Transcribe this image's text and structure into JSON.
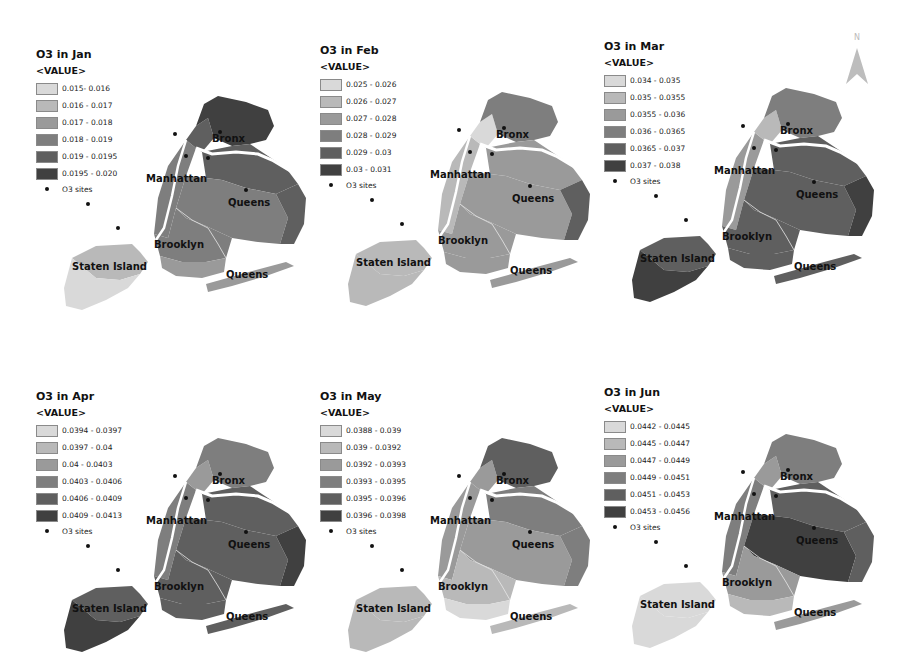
{
  "north_arrow": {
    "label": "N",
    "icon": "north-arrow-icon"
  },
  "legend_header": "<VALUE>",
  "sites_label": "O3 sites",
  "boroughs": {
    "bronx": "Bronx",
    "manhattan": "Manhattan",
    "queens": "Queens",
    "brooklyn": "Brooklyn",
    "staten_island": "Staten Island",
    "queens_south": "Queens"
  },
  "class_colors": [
    "#d9d9d9",
    "#b9b9b9",
    "#9a9a9a",
    "#7e7e7e",
    "#5f5f5f",
    "#404040"
  ],
  "panels": [
    {
      "title": "O3 in Jan",
      "legend": [
        "0.015- 0.016",
        "0.016 - 0.017",
        "0.017 - 0.018",
        "0.018 - 0.019",
        "0.019 - 0.0195",
        "0.0195 - 0.020"
      ],
      "zones": {
        "bronx": 5,
        "manhattan": 3,
        "upper_manhattan": 4,
        "queens_north": 4,
        "queens": 3,
        "queens_east": 4,
        "brooklyn": 3,
        "brooklyn_south": 2,
        "staten_island": 1,
        "staten_south": 0,
        "rockaway": 2
      }
    },
    {
      "title": "O3 in Feb",
      "legend": [
        "0.025 - 0.026",
        "0.026 - 0.027",
        "0.027 - 0.028",
        "0.028 - 0.029",
        "0.029 - 0.03",
        "0.03 - 0.031"
      ],
      "zones": {
        "bronx": 3,
        "manhattan": 1,
        "upper_manhattan": 0,
        "queens_north": 2,
        "queens": 2,
        "queens_east": 4,
        "brooklyn": 2,
        "brooklyn_south": 2,
        "staten_island": 1,
        "staten_south": 1,
        "rockaway": 2
      }
    },
    {
      "title": "O3 in Mar",
      "legend": [
        "0.034 - 0.035",
        "0.035 - 0.0355",
        "0.0355 - 0.036",
        "0.036 - 0.0365",
        "0.0365 - 0.037",
        "0.037 - 0.038"
      ],
      "zones": {
        "bronx": 3,
        "manhattan": 2,
        "upper_manhattan": 1,
        "queens_north": 4,
        "queens": 4,
        "queens_east": 5,
        "brooklyn": 4,
        "brooklyn_south": 4,
        "staten_island": 4,
        "staten_south": 5,
        "rockaway": 4
      }
    },
    {
      "title": "O3 in Apr",
      "legend": [
        "0.0394 - 0.0397",
        "0.0397 - 0.04",
        "0.04 - 0.0403",
        "0.0403 - 0.0406",
        "0.0406 - 0.0409",
        "0.0409 - 0.0413"
      ],
      "zones": {
        "bronx": 3,
        "manhattan": 3,
        "upper_manhattan": 2,
        "queens_north": 4,
        "queens": 4,
        "queens_east": 5,
        "brooklyn": 4,
        "brooklyn_south": 4,
        "staten_island": 4,
        "staten_south": 5,
        "rockaway": 4
      }
    },
    {
      "title": "O3 in May",
      "legend": [
        "0.0388 - 0.039",
        "0.039 - 0.0392",
        "0.0392 - 0.0393",
        "0.0393 - 0.0395",
        "0.0395 - 0.0396",
        "0.0396 - 0.0398"
      ],
      "zones": {
        "bronx": 4,
        "manhattan": 2,
        "upper_manhattan": 2,
        "queens_north": 3,
        "queens": 2,
        "queens_east": 3,
        "brooklyn": 1,
        "brooklyn_south": 0,
        "staten_island": 1,
        "staten_south": 1,
        "rockaway": 1
      }
    },
    {
      "title": "O3 in Jun",
      "legend": [
        "0.0442 - 0.0445",
        "0.0445 - 0.0447",
        "0.0447 - 0.0449",
        "0.0449 - 0.0451",
        "0.0451 - 0.0453",
        "0.0453 - 0.0456"
      ],
      "zones": {
        "bronx": 3,
        "manhattan": 3,
        "upper_manhattan": 2,
        "queens_north": 4,
        "queens": 5,
        "queens_east": 4,
        "brooklyn": 2,
        "brooklyn_south": 1,
        "staten_island": 0,
        "staten_south": 0,
        "rockaway": 2
      }
    }
  ],
  "chart_data": {
    "type": "heatmap",
    "panels": [
      {
        "month": "Jan",
        "classes": [
          "0.015- 0.016",
          "0.016 - 0.017",
          "0.017 - 0.018",
          "0.018 - 0.019",
          "0.019 - 0.0195",
          "0.0195 - 0.020"
        ],
        "range": [
          0.015,
          0.02
        ]
      },
      {
        "month": "Feb",
        "classes": [
          "0.025 - 0.026",
          "0.026 - 0.027",
          "0.027 - 0.028",
          "0.028 - 0.029",
          "0.029 - 0.03",
          "0.03 - 0.031"
        ],
        "range": [
          0.025,
          0.031
        ]
      },
      {
        "month": "Mar",
        "classes": [
          "0.034 - 0.035",
          "0.035 - 0.0355",
          "0.0355 - 0.036",
          "0.036 - 0.0365",
          "0.0365 - 0.037",
          "0.037 - 0.038"
        ],
        "range": [
          0.034,
          0.038
        ]
      },
      {
        "month": "Apr",
        "classes": [
          "0.0394 - 0.0397",
          "0.0397 - 0.04",
          "0.04 - 0.0403",
          "0.0403 - 0.0406",
          "0.0406 - 0.0409",
          "0.0409 - 0.0413"
        ],
        "range": [
          0.0394,
          0.0413
        ]
      },
      {
        "month": "May",
        "classes": [
          "0.0388 - 0.039",
          "0.039 - 0.0392",
          "0.0392 - 0.0393",
          "0.0393 - 0.0395",
          "0.0395 - 0.0396",
          "0.0396 - 0.0398"
        ],
        "range": [
          0.0388,
          0.0398
        ]
      },
      {
        "month": "Jun",
        "classes": [
          "0.0442 - 0.0445",
          "0.0445 - 0.0447",
          "0.0447 - 0.0449",
          "0.0449 - 0.0451",
          "0.0451 - 0.0453",
          "0.0453 - 0.0456"
        ],
        "range": [
          0.0442,
          0.0456
        ]
      }
    ],
    "legend_title": "<VALUE>",
    "point_layer": "O3 sites",
    "labels": [
      "Bronx",
      "Manhattan",
      "Queens",
      "Brooklyn",
      "Staten Island",
      "Queens"
    ]
  }
}
